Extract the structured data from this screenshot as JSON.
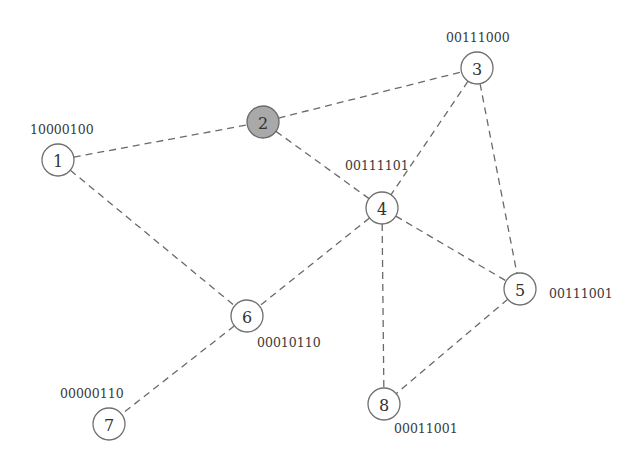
{
  "diagram": {
    "type": "graph",
    "node_radius": 16,
    "colors": {
      "highlight_fill": "#a9a9a9",
      "node_fill": "#ffffff",
      "edge": "#6a6a6a"
    },
    "nodes": [
      {
        "id": "1",
        "label": "1",
        "code": "10000100",
        "x": 58,
        "y": 160,
        "highlighted": false,
        "code_x": 30,
        "code_y": 134
      },
      {
        "id": "2",
        "label": "2",
        "code": "",
        "x": 263,
        "y": 122,
        "highlighted": true,
        "code_x": 0,
        "code_y": 0
      },
      {
        "id": "3",
        "label": "3",
        "code": "00111000",
        "x": 477,
        "y": 68,
        "highlighted": false,
        "code_x": 446,
        "code_y": 42
      },
      {
        "id": "4",
        "label": "4",
        "code": "00111101",
        "x": 382,
        "y": 208,
        "highlighted": false,
        "code_x": 345,
        "code_y": 170
      },
      {
        "id": "5",
        "label": "5",
        "code": "00111001",
        "x": 520,
        "y": 289,
        "highlighted": false,
        "code_x": 549,
        "code_y": 298
      },
      {
        "id": "6",
        "label": "6",
        "code": "00010110",
        "x": 247,
        "y": 316,
        "highlighted": false,
        "code_x": 257,
        "code_y": 347
      },
      {
        "id": "7",
        "label": "7",
        "code": "00000110",
        "x": 109,
        "y": 424,
        "highlighted": false,
        "code_x": 60,
        "code_y": 398
      },
      {
        "id": "8",
        "label": "8",
        "code": "00011001",
        "x": 384,
        "y": 404,
        "highlighted": false,
        "code_x": 394,
        "code_y": 433
      }
    ],
    "edges": [
      [
        "1",
        "2"
      ],
      [
        "1",
        "6"
      ],
      [
        "2",
        "3"
      ],
      [
        "2",
        "4"
      ],
      [
        "3",
        "4"
      ],
      [
        "3",
        "5"
      ],
      [
        "4",
        "5"
      ],
      [
        "4",
        "6"
      ],
      [
        "4",
        "8"
      ],
      [
        "5",
        "8"
      ],
      [
        "6",
        "7"
      ]
    ]
  }
}
